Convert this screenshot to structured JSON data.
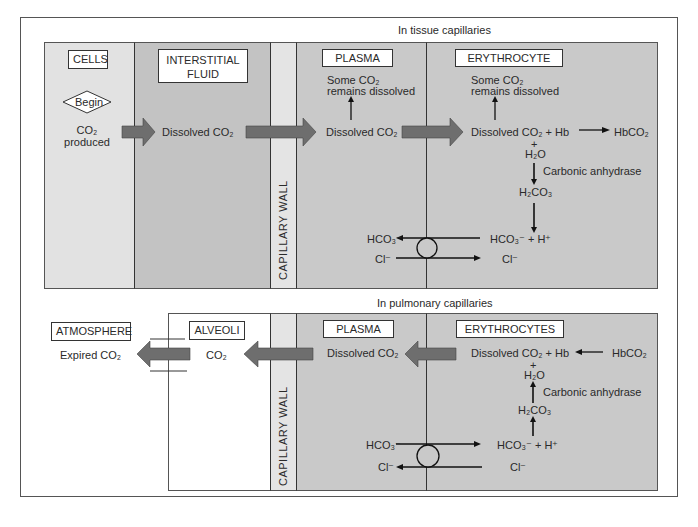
{
  "tissue": {
    "caption": "In tissue capillaries",
    "cells": {
      "label": "CELLS",
      "begin": "Begin",
      "co2_line1": "CO₂",
      "co2_line2": "produced"
    },
    "interstitial": {
      "label_line1": "INTERSTITIAL",
      "label_line2": "FLUID",
      "text": "Dissolved CO₂"
    },
    "capillary_wall": "CAPILLARY WALL",
    "plasma": {
      "label": "PLASMA",
      "some_line1": "Some CO₂",
      "some_line2": "remains dissolved",
      "dissolved": "Dissolved CO₂",
      "hco3": "HCO₃⁻",
      "cl": "Cl⁻"
    },
    "erythrocyte": {
      "label": "ERYTHROCYTE",
      "some_line1": "Some CO₂",
      "some_line2": "remains dissolved",
      "reaction": "Dissolved CO₂ + Hb",
      "product": "HbCO₂",
      "plus": "+",
      "h2o": "H₂O",
      "enzyme": "Carbonic anhydrase",
      "h2co3": "H₂CO₃",
      "ions": "HCO₃⁻  +  H⁺",
      "cl": "Cl⁻"
    }
  },
  "pulmonary": {
    "caption": "In pulmonary capillaries",
    "atmosphere": {
      "label": "ATMOSPHERE",
      "text": "Expired CO₂"
    },
    "alveoli": {
      "label": "ALVEOLI",
      "text": "CO₂"
    },
    "capillary_wall": "CAPILLARY WALL",
    "plasma": {
      "label": "PLASMA",
      "dissolved": "Dissolved CO₂",
      "hco3": "HCO₃⁻",
      "cl": "Cl⁻"
    },
    "erythrocytes": {
      "label": "ERYTHROCYTES",
      "reaction": "Dissolved CO₂ + Hb",
      "reactant": "HbCO₂",
      "plus": "+",
      "h2o": "H₂O",
      "enzyme": "Carbonic anhydrase",
      "h2co3": "H₂CO₃",
      "ions": "HCO₃⁻ + H⁺",
      "cl": "Cl⁻"
    }
  },
  "colors": {
    "cells": "#e2e2e2",
    "interstitial": "#c3c3c3",
    "wall": "#e4e4e4",
    "plasma": "#c9c9c9",
    "erythrocyte": "#c9c9c9",
    "arrow": "#6e6e6e"
  }
}
